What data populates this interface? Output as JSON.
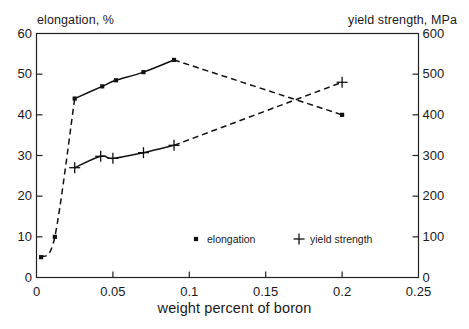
{
  "chart_data": {
    "type": "scatter",
    "title": "",
    "xlabel": "weight percent of boron",
    "ylabel_left": "elongation, %",
    "ylabel_right": "yield strength, MPa",
    "xlim": [
      0,
      0.25
    ],
    "ylim_left": [
      0,
      60
    ],
    "ylim_right": [
      0,
      600
    ],
    "xticks": [
      "0",
      "0.05",
      "0.1",
      "0.15",
      "0.2",
      "0.25"
    ],
    "xtick_values": [
      0,
      0.05,
      0.1,
      0.15,
      0.2,
      0.25
    ],
    "yticks_left": [
      "0",
      "10",
      "20",
      "30",
      "40",
      "50",
      "60"
    ],
    "ytick_values_left": [
      0,
      10,
      20,
      30,
      40,
      50,
      60
    ],
    "yticks_right": [
      "0",
      "100",
      "200",
      "300",
      "400",
      "500",
      "600"
    ],
    "ytick_values_right": [
      0,
      100,
      200,
      300,
      400,
      500,
      600
    ],
    "grid": false,
    "legend_position": "inside-bottom-center",
    "series": [
      {
        "name": "elongation",
        "marker": "square",
        "axis": "left",
        "unit": "%",
        "x": [
          0.003,
          0.012,
          0.025,
          0.043,
          0.052,
          0.07,
          0.09,
          0.2
        ],
        "values": [
          5,
          10,
          44,
          47,
          48.5,
          50.5,
          53.5,
          40
        ]
      },
      {
        "name": "yield strength",
        "marker": "plus",
        "axis": "right",
        "unit": "MPa",
        "x": [
          0.025,
          0.042,
          0.05,
          0.07,
          0.09,
          0.2
        ],
        "values": [
          270,
          298,
          293,
          307,
          325,
          480
        ]
      }
    ],
    "legend": [
      {
        "label": "elongation",
        "marker": "square"
      },
      {
        "label": "yield strength",
        "marker": "plus"
      }
    ]
  }
}
